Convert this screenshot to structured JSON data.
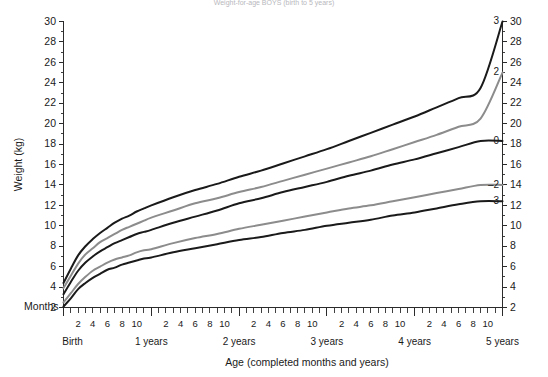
{
  "chart": {
    "title": "Weight-for-age BOYS (birth to 5 years)",
    "xlabel": "Age (completed months and years)",
    "ylabel": "Weight (kg)",
    "months_label": "Months",
    "birth_label": "Birth"
  },
  "chart_data": {
    "type": "line",
    "title": "Weight-for-age BOYS (birth to 5 years)",
    "xlabel": "Age (completed months and years)",
    "ylabel": "Weight (kg)",
    "xlim": [
      0,
      60
    ],
    "ylim": [
      2,
      30
    ],
    "grid": false,
    "legend_position": "right-curve-end",
    "x_unit": "months",
    "x_tick_values": [
      0,
      1,
      2,
      3,
      4,
      5,
      6,
      7,
      8,
      9,
      10,
      11,
      12,
      13,
      14,
      15,
      16,
      17,
      18,
      19,
      20,
      21,
      22,
      23,
      24,
      25,
      26,
      27,
      28,
      29,
      30,
      31,
      32,
      33,
      34,
      35,
      36,
      37,
      38,
      39,
      40,
      41,
      42,
      43,
      44,
      45,
      46,
      47,
      48,
      49,
      50,
      51,
      52,
      53,
      54,
      55,
      56,
      57,
      58,
      59,
      60
    ],
    "x_tick_labels": [
      "2",
      "4",
      "6",
      "8",
      "10",
      "2",
      "4",
      "6",
      "8",
      "10",
      "2",
      "4",
      "6",
      "8",
      "10",
      "2",
      "4",
      "6",
      "8",
      "10",
      "2",
      "4",
      "6",
      "8",
      "10"
    ],
    "x_tick_label_months": [
      2,
      4,
      6,
      8,
      10,
      14,
      16,
      18,
      20,
      22,
      26,
      28,
      30,
      32,
      34,
      38,
      40,
      42,
      44,
      46,
      50,
      52,
      54,
      56,
      58
    ],
    "x_year_labels": [
      "Birth",
      "1 years",
      "2 years",
      "3 years",
      "4 years",
      "5 years"
    ],
    "x_year_positions": [
      0,
      12,
      24,
      36,
      48,
      60
    ],
    "y_tick_values": [
      2,
      4,
      6,
      8,
      10,
      12,
      14,
      16,
      18,
      20,
      22,
      24,
      26,
      28,
      30
    ],
    "y_tick_labels": [
      "2",
      "4",
      "6",
      "8",
      "10",
      "12",
      "14",
      "16",
      "18",
      "20",
      "22",
      "24",
      "26",
      "28",
      "30"
    ],
    "y_right_tick_values": [
      2,
      4,
      6,
      8,
      10,
      12,
      14,
      16,
      18,
      20,
      22,
      24,
      26,
      28,
      30
    ],
    "y_right_tick_labels": [
      "2",
      "4",
      "6",
      "8",
      "10",
      "12",
      "14",
      "16",
      "18",
      "20",
      "22",
      "24",
      "26",
      "28",
      "30"
    ],
    "series": [
      {
        "name": "3",
        "label": "3",
        "color": "#1a1a1a",
        "width": 2.0,
        "x": [
          0,
          1,
          2,
          3,
          4,
          5,
          6,
          7,
          8,
          9,
          10,
          11,
          12,
          15,
          18,
          21,
          24,
          27,
          30,
          33,
          36,
          39,
          42,
          45,
          48,
          51,
          54,
          57,
          60
        ],
        "values": [
          4.4,
          5.8,
          7.1,
          8.0,
          8.7,
          9.3,
          9.8,
          10.3,
          10.7,
          11.0,
          11.4,
          11.7,
          12.0,
          12.8,
          13.5,
          14.1,
          14.8,
          15.4,
          16.1,
          16.8,
          17.5,
          18.3,
          19.1,
          19.9,
          20.7,
          21.6,
          22.5,
          23.5,
          30.0
        ]
      },
      {
        "name": "2",
        "label": "2",
        "color": "#8c8c8c",
        "width": 2.0,
        "x": [
          0,
          1,
          2,
          3,
          4,
          5,
          6,
          7,
          8,
          9,
          10,
          11,
          12,
          15,
          18,
          21,
          24,
          27,
          30,
          33,
          36,
          39,
          42,
          45,
          48,
          51,
          54,
          57,
          60
        ],
        "values": [
          3.9,
          5.1,
          6.3,
          7.2,
          7.8,
          8.4,
          8.8,
          9.2,
          9.6,
          9.9,
          10.2,
          10.5,
          10.8,
          11.5,
          12.2,
          12.7,
          13.3,
          13.8,
          14.4,
          15.0,
          15.6,
          16.2,
          16.8,
          17.5,
          18.2,
          18.9,
          19.7,
          20.5,
          25.0
        ]
      },
      {
        "name": "0",
        "label": "0",
        "color": "#1a1a1a",
        "width": 2.0,
        "x": [
          0,
          1,
          2,
          3,
          4,
          5,
          6,
          7,
          8,
          9,
          10,
          11,
          12,
          15,
          18,
          21,
          24,
          27,
          30,
          33,
          36,
          39,
          42,
          45,
          48,
          51,
          54,
          57,
          60
        ],
        "values": [
          3.3,
          4.5,
          5.6,
          6.4,
          7.0,
          7.5,
          7.9,
          8.3,
          8.6,
          8.9,
          9.2,
          9.4,
          9.6,
          10.3,
          10.9,
          11.5,
          12.2,
          12.7,
          13.3,
          13.8,
          14.3,
          14.9,
          15.4,
          16.0,
          16.5,
          17.1,
          17.7,
          18.3,
          18.3
        ]
      },
      {
        "name": "-2",
        "label": "–2",
        "color": "#8c8c8c",
        "width": 2.0,
        "x": [
          0,
          1,
          2,
          3,
          4,
          5,
          6,
          7,
          8,
          9,
          10,
          11,
          12,
          15,
          18,
          21,
          24,
          27,
          30,
          33,
          36,
          39,
          42,
          45,
          48,
          51,
          54,
          57,
          60
        ],
        "values": [
          2.5,
          3.4,
          4.3,
          5.0,
          5.6,
          6.0,
          6.4,
          6.7,
          6.9,
          7.1,
          7.4,
          7.6,
          7.7,
          8.3,
          8.8,
          9.2,
          9.7,
          10.1,
          10.5,
          10.9,
          11.3,
          11.7,
          12.0,
          12.4,
          12.8,
          13.2,
          13.6,
          14.0,
          14.0
        ]
      },
      {
        "name": "-3",
        "label": "–3",
        "color": "#1a1a1a",
        "width": 2.0,
        "x": [
          0,
          1,
          2,
          3,
          4,
          5,
          6,
          7,
          8,
          9,
          10,
          11,
          12,
          15,
          18,
          21,
          24,
          27,
          30,
          33,
          36,
          39,
          42,
          45,
          48,
          51,
          54,
          57,
          60
        ],
        "values": [
          2.1,
          2.9,
          3.8,
          4.4,
          4.9,
          5.3,
          5.7,
          5.9,
          6.2,
          6.4,
          6.6,
          6.8,
          6.9,
          7.4,
          7.8,
          8.2,
          8.6,
          8.9,
          9.3,
          9.6,
          10.0,
          10.3,
          10.6,
          11.0,
          11.3,
          11.7,
          12.1,
          12.4,
          12.4
        ]
      }
    ]
  },
  "colors": {
    "curve_black": "#1a1a1a",
    "curve_gray": "#8c8c8c",
    "axis": "#2b2b2b",
    "background": "#ffffff",
    "title_faint": "#b8b8bd"
  }
}
